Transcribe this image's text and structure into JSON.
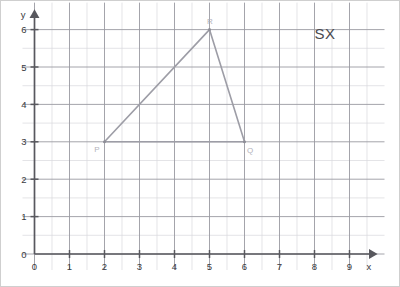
{
  "chart_data": {
    "type": "scatter",
    "title": "",
    "xlabel": "x",
    "ylabel": "y",
    "xlim": [
      0,
      9.6
    ],
    "ylim": [
      0,
      6.4
    ],
    "grid": true,
    "grid_major_step": 1,
    "grid_minor_step": 0.5,
    "legend": "none",
    "x_ticks": [
      "0",
      "1",
      "2",
      "3",
      "4",
      "5",
      "6",
      "7",
      "8",
      "9"
    ],
    "x_tick_values": [
      0,
      1,
      2,
      3,
      4,
      5,
      6,
      7,
      8,
      9
    ],
    "y_ticks": [
      "0",
      "1",
      "2",
      "3",
      "4",
      "5",
      "6"
    ],
    "y_tick_values": [
      0,
      1,
      2,
      3,
      4,
      5,
      6
    ],
    "origin_label": "0",
    "shapes": [
      {
        "name": "triangle-PQR",
        "closed": true,
        "points": [
          {
            "label": "P",
            "x": 2,
            "y": 3
          },
          {
            "label": "Q",
            "x": 6,
            "y": 3
          },
          {
            "label": "R",
            "x": 5,
            "y": 6
          }
        ]
      }
    ],
    "annotations": [
      {
        "name": "sx-note",
        "text": "SX",
        "x": 8.3,
        "y": 5.75
      }
    ]
  },
  "axes": {
    "x_label": "x",
    "y_label": "y",
    "origin": "0",
    "x_ticks": [
      "0",
      "1",
      "2",
      "3",
      "4",
      "5",
      "6",
      "7",
      "8",
      "9"
    ],
    "y_ticks": [
      "0",
      "1",
      "2",
      "3",
      "4",
      "5",
      "6"
    ]
  },
  "vertices": {
    "p": "P",
    "q": "Q",
    "r": "R"
  },
  "annotation": {
    "sx": "SX"
  },
  "colors": {
    "background": "#ffffff",
    "minor_grid": "#d8d8dc",
    "major_grid": "#9a9aa2",
    "axis": "#58585e",
    "shape_stroke": "#9d9da6",
    "vertex_label": "#b3b3bb",
    "annotation": "#4a4a50",
    "frame": "#cfcfcf"
  }
}
